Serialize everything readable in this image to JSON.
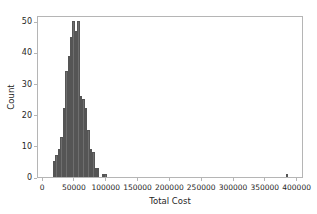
{
  "chart_data": {
    "type": "bar",
    "subtype": "histogram",
    "title": "",
    "xlabel": "Total Cost",
    "ylabel": "Count",
    "xlim": [
      -8000,
      410000
    ],
    "ylim": [
      0,
      52
    ],
    "grid": false,
    "legend": null,
    "bar_color": "#6e6e6e",
    "edge_color": "#555555",
    "axes_color": "#b5b5b5",
    "background": "#ffffff",
    "xticks": [
      0,
      50000,
      100000,
      150000,
      200000,
      250000,
      300000,
      350000,
      400000
    ],
    "xtick_labels": [
      "0",
      "50000",
      "100000",
      "150000",
      "200000",
      "250000",
      "300000",
      "350000",
      "400000"
    ],
    "yticks": [
      0,
      10,
      20,
      30,
      40,
      50
    ],
    "ytick_labels": [
      "0",
      "10",
      "20",
      "30",
      "40",
      "50"
    ],
    "bin_width": 3850,
    "bins": [
      {
        "x0": 15400,
        "x1": 19250,
        "count": 5
      },
      {
        "x0": 19250,
        "x1": 23100,
        "count": 7
      },
      {
        "x0": 23100,
        "x1": 26950,
        "count": 9
      },
      {
        "x0": 26950,
        "x1": 30800,
        "count": 13
      },
      {
        "x0": 30800,
        "x1": 34650,
        "count": 22
      },
      {
        "x0": 34650,
        "x1": 38500,
        "count": 34
      },
      {
        "x0": 38500,
        "x1": 42350,
        "count": 39
      },
      {
        "x0": 42350,
        "x1": 46200,
        "count": 45
      },
      {
        "x0": 46200,
        "x1": 50050,
        "count": 50
      },
      {
        "x0": 50050,
        "x1": 53900,
        "count": 47
      },
      {
        "x0": 53900,
        "x1": 57750,
        "count": 50
      },
      {
        "x0": 57750,
        "x1": 61600,
        "count": 26
      },
      {
        "x0": 61600,
        "x1": 65450,
        "count": 25
      },
      {
        "x0": 65450,
        "x1": 69300,
        "count": 22
      },
      {
        "x0": 69300,
        "x1": 73150,
        "count": 15
      },
      {
        "x0": 73150,
        "x1": 77000,
        "count": 9
      },
      {
        "x0": 77000,
        "x1": 80850,
        "count": 8
      },
      {
        "x0": 80850,
        "x1": 84700,
        "count": 3
      },
      {
        "x0": 84700,
        "x1": 88550,
        "count": 3
      },
      {
        "x0": 88550,
        "x1": 92400,
        "count": 0
      },
      {
        "x0": 92400,
        "x1": 96250,
        "count": 1
      },
      {
        "x0": 96250,
        "x1": 100100,
        "count": 1
      },
      {
        "x0": 381150,
        "x1": 385000,
        "count": 1
      }
    ]
  }
}
